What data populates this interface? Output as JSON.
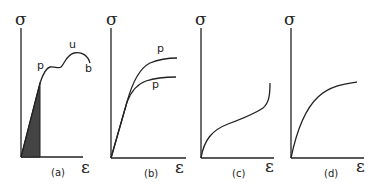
{
  "figure": {
    "panels": [
      {
        "id": "a",
        "caption": "(a)",
        "y_axis_label": "σ",
        "x_axis_label": "ε",
        "point_labels": {
          "p": "p",
          "u": "u",
          "b": "b"
        },
        "description": "Linear elastic region (shaded area under curve up to proportional limit p), yield plateau, ultimate point u, break point b"
      },
      {
        "id": "b",
        "caption": "(b)",
        "y_axis_label": "σ",
        "x_axis_label": "ε",
        "point_labels": {
          "p_upper": "p",
          "p_lower": "p"
        },
        "description": "Two curves with initial linear region then leveling off, each with proportional limit p"
      },
      {
        "id": "c",
        "caption": "(c)",
        "y_axis_label": "σ",
        "x_axis_label": "ε",
        "description": "S-shaped curve: concave down initially then stiffening (concave up)"
      },
      {
        "id": "d",
        "caption": "(d)",
        "y_axis_label": "σ",
        "x_axis_label": "ε",
        "description": "Nonlinear concave-down curve approaching a plateau"
      }
    ],
    "colors": {
      "line": "#222222",
      "shade": "#444444",
      "background": "#ffffff"
    }
  }
}
